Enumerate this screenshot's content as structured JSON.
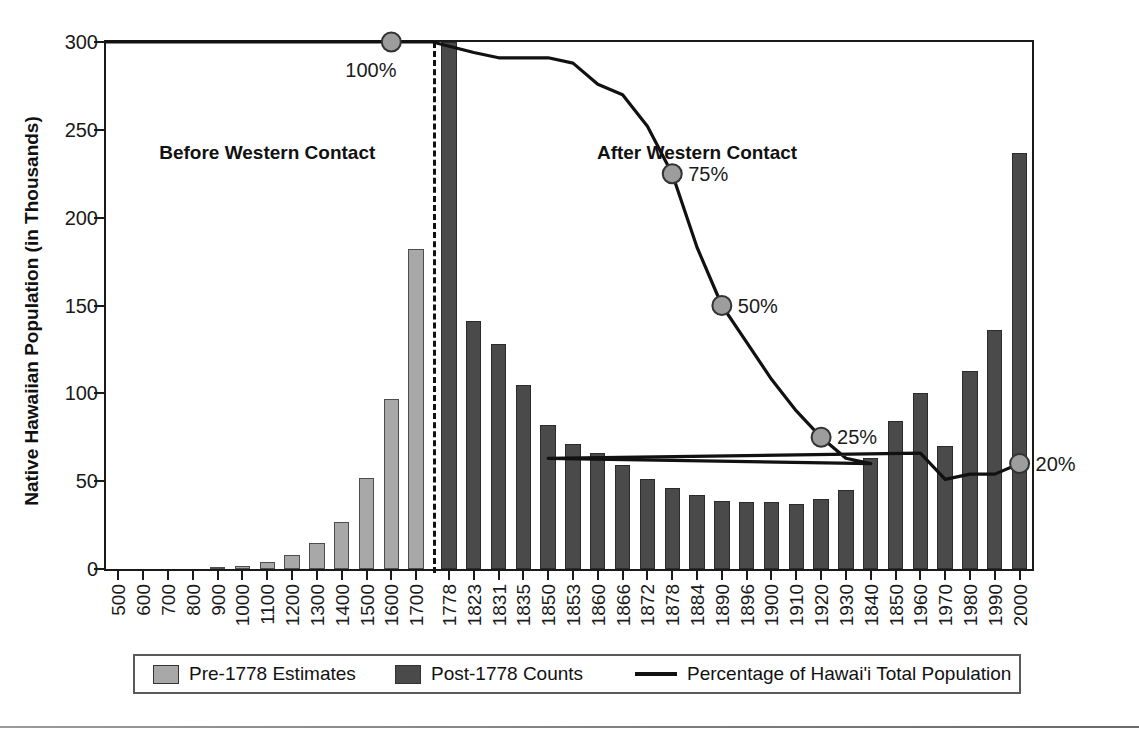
{
  "chart_data": {
    "type": "bar",
    "title": "",
    "xlabel": "",
    "ylabel": "Native Hawaiian Population (in Thousands)",
    "ylim": [
      0,
      300
    ],
    "yticks": [
      0,
      50,
      100,
      150,
      200,
      250,
      300
    ],
    "grid": false,
    "legend_position": "bottom",
    "categories": [
      "500",
      "600",
      "700",
      "800",
      "900",
      "1000",
      "1100",
      "1200",
      "1300",
      "1400",
      "1500",
      "1600",
      "1700",
      "1778",
      "1823",
      "1831",
      "1835",
      "1850",
      "1853",
      "1860",
      "1866",
      "1872",
      "1878",
      "1884",
      "1890",
      "1896",
      "1900",
      "1910",
      "1920",
      "1930",
      "1840",
      "1850",
      "1960",
      "1970",
      "1980",
      "1990",
      "2000"
    ],
    "series": [
      {
        "name": "Pre-1778 Estimates",
        "color": "#a8a8a8",
        "values": [
          0,
          0,
          0,
          0,
          1,
          2,
          4,
          8,
          15,
          27,
          52,
          97,
          182,
          null,
          null,
          null,
          null,
          null,
          null,
          null,
          null,
          null,
          null,
          null,
          null,
          null,
          null,
          null,
          null,
          null,
          null,
          null,
          null,
          null,
          null,
          null,
          null
        ]
      },
      {
        "name": "Post-1778 Counts",
        "color": "#4a4a4a",
        "values": [
          null,
          null,
          null,
          null,
          null,
          null,
          null,
          null,
          null,
          null,
          null,
          null,
          null,
          300,
          141,
          128,
          105,
          82,
          71,
          66,
          59,
          51,
          46,
          42,
          39,
          38,
          38,
          37,
          40,
          45,
          63,
          84,
          100,
          70,
          113,
          136,
          237
        ]
      }
    ],
    "line_series": {
      "name": "Percentage of Hawai'i Total Population",
      "color": "#111111",
      "axis_note": "plotted on same frame; 100% aligns with top of plot (300k line)",
      "points_percent": [
        {
          "category": "500",
          "percent": 100
        },
        {
          "category": "1600",
          "percent": 100,
          "marked": true,
          "label": "100%"
        },
        {
          "category": "1778",
          "percent": 100
        },
        {
          "category": "1823",
          "percent": 98
        },
        {
          "category": "1831",
          "percent": 97
        },
        {
          "category": "1835",
          "percent": 97
        },
        {
          "category": "1850",
          "percent": 97
        },
        {
          "category": "1853",
          "percent": 96
        },
        {
          "category": "1860",
          "percent": 92
        },
        {
          "category": "1866",
          "percent": 90
        },
        {
          "category": "1872",
          "percent": 84
        },
        {
          "category": "1878",
          "percent": 75,
          "marked": true,
          "label": "75%"
        },
        {
          "category": "1884",
          "percent": 61
        },
        {
          "category": "1890",
          "percent": 50,
          "marked": true,
          "label": "50%"
        },
        {
          "category": "1896",
          "percent": 43
        },
        {
          "category": "1900",
          "percent": 36
        },
        {
          "category": "1910",
          "percent": 30
        },
        {
          "category": "1920",
          "percent": 25,
          "marked": true,
          "label": "25%"
        },
        {
          "category": "1930",
          "percent": 21
        },
        {
          "category": "1840",
          "percent": 20
        },
        {
          "category": "1850",
          "percent": 21
        },
        {
          "category": "1960",
          "percent": 22
        },
        {
          "category": "1970",
          "percent": 17
        },
        {
          "category": "1980",
          "percent": 18
        },
        {
          "category": "1990",
          "percent": 18
        },
        {
          "category": "2000",
          "percent": 20,
          "marked": true,
          "label": "20%"
        }
      ]
    },
    "annotations": [
      {
        "text": "Before Western Contact",
        "category": "1100"
      },
      {
        "text": "After Western Contact",
        "category": "1890"
      }
    ],
    "divider": {
      "after_category": "1700",
      "style": "dashed"
    }
  },
  "yaxis": {
    "label": "Native Hawaiian Population (in Thousands)",
    "ticks": [
      "300",
      "250",
      "200",
      "150",
      "100",
      "50",
      "0"
    ]
  },
  "xaxis": {
    "ticks": [
      "500",
      "600",
      "700",
      "800",
      "900",
      "1000",
      "1100",
      "1200",
      "1300",
      "1400",
      "1500",
      "1600",
      "1700",
      "1778",
      "1823",
      "1831",
      "1835",
      "1850",
      "1853",
      "1860",
      "1866",
      "1872",
      "1878",
      "1884",
      "1890",
      "1896",
      "1900",
      "1910",
      "1920",
      "1930",
      "1840",
      "1850",
      "1960",
      "1970",
      "1980",
      "1990",
      "2000"
    ]
  },
  "regions": {
    "before": "Before Western Contact",
    "after": "After Western Contact"
  },
  "percent_markers": [
    {
      "label": "100%"
    },
    {
      "label": "75%"
    },
    {
      "label": "50%"
    },
    {
      "label": "25%"
    },
    {
      "label": "20%"
    }
  ],
  "legend": {
    "items": [
      {
        "label": "Pre-1778 Estimates",
        "kind": "swatch-pre"
      },
      {
        "label": "Post-1778 Counts",
        "kind": "swatch-post"
      },
      {
        "label": "Percentage of Hawai'i Total Population",
        "kind": "line"
      }
    ]
  }
}
